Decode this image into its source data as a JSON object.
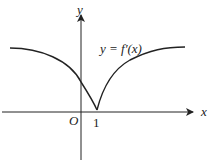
{
  "diagram": {
    "curve_label": "y = f′(x)",
    "axis_x_label": "x",
    "axis_y_label": "y",
    "origin_label": "O",
    "tick_label": "1",
    "colors": {
      "stroke": "#222222",
      "background": "#ffffff"
    }
  }
}
